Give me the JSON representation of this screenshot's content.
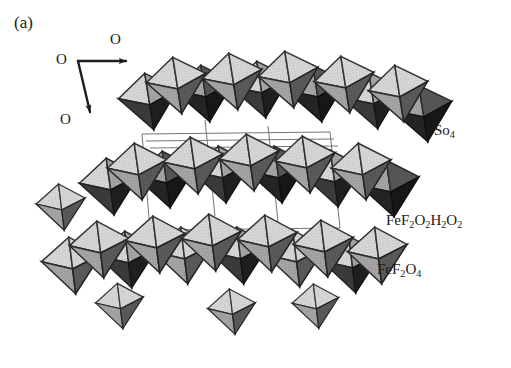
{
  "figure": {
    "panel_label": "(a)",
    "type": "crystal-structure-polyhedral-diagram",
    "background_color": "#ffffff"
  },
  "axes": {
    "origin_label": "O",
    "right_label": "O",
    "down_label": "O"
  },
  "labels": {
    "so4": "So4",
    "so4_parts": {
      "base": "So",
      "sub": "4"
    },
    "fef2o2h2o2_parts": [
      {
        "base": "FeF",
        "sub": "2"
      },
      {
        "base": "O",
        "sub": "2"
      },
      {
        "base": "H",
        "sub": "2"
      },
      {
        "base": "O",
        "sub": "2"
      }
    ],
    "fef2o4_parts": [
      {
        "base": "FeF",
        "sub": "2"
      },
      {
        "base": "O",
        "sub": "4"
      }
    ]
  },
  "colors": {
    "face_light": "#d2d2d2",
    "face_mid": "#9a9a9a",
    "face_dark": "#4a4a4a",
    "face_black": "#232323",
    "edge": "#2b2b2b",
    "cell_line": "#6b6b6b",
    "text": "#1a1a1a"
  }
}
